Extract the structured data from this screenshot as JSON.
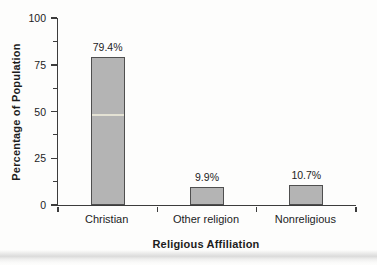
{
  "figure": {
    "width": 377,
    "height": 265,
    "background": "#fdfdfc",
    "text_color": "#1c1c1c",
    "axis_color": "#3c3c3c"
  },
  "chart_data": {
    "type": "bar",
    "title": "",
    "categories": [
      "Christian",
      "Other religion",
      "Nonreligious"
    ],
    "values": [
      79.4,
      9.9,
      10.7
    ],
    "value_labels": [
      "79.4%",
      "9.9%",
      "10.7%"
    ],
    "xlabel": "Religious Affiliation",
    "ylabel": "Percentage of Population",
    "ylim": [
      0,
      100
    ],
    "yticks": [
      0,
      25,
      50,
      75,
      100
    ],
    "ytick_labels": [
      "0",
      "25",
      "50",
      "75",
      "100"
    ],
    "yticks_minor": [
      12.5,
      37.5,
      62.5,
      87.5
    ],
    "grid": "off",
    "legend": "none",
    "bar_color": "#b4b4b4",
    "bar_border_color": "#4f4f4f"
  },
  "scan_artifacts": {
    "highlight_line": {
      "bar_index": 0,
      "value_percent": 47,
      "color": "#ecead9"
    },
    "bottom_band": true
  }
}
